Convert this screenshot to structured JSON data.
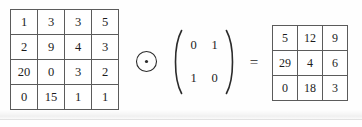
{
  "equation": {
    "operator_symbol": "circled-dot",
    "equals_symbol": "=",
    "left_paren_symbol": "(",
    "right_paren_symbol": ")"
  },
  "input_matrix": {
    "name": "input-matrix",
    "rows": 4,
    "cols": 4,
    "values": [
      [
        "1",
        "3",
        "3",
        "5"
      ],
      [
        "2",
        "9",
        "4",
        "3"
      ],
      [
        "20",
        "0",
        "3",
        "2"
      ],
      [
        "0",
        "15",
        "1",
        "1"
      ]
    ]
  },
  "kernel_matrix": {
    "name": "kernel-matrix",
    "rows": 2,
    "cols": 2,
    "values": [
      [
        "0",
        "1"
      ],
      [
        "1",
        "0"
      ]
    ]
  },
  "output_matrix": {
    "name": "output-matrix",
    "rows": 3,
    "cols": 3,
    "values": [
      [
        "5",
        "12",
        "9"
      ],
      [
        "29",
        "4",
        "6"
      ],
      [
        "0",
        "18",
        "3"
      ]
    ]
  },
  "colors": {
    "grid_border": "#5b5b5b",
    "text": "#1c1c1c",
    "background": "#fefefe",
    "cell_fill": "#ffffff"
  }
}
